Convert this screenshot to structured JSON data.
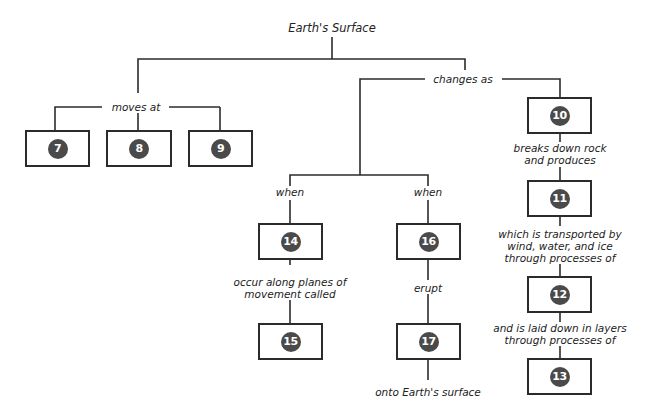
{
  "diagram": {
    "title": "Earth's Surface",
    "links": {
      "moves_at": "moves at",
      "changes_as": "changes as",
      "when_left": "when",
      "when_right": "when",
      "occur_along_1": "occur along planes of",
      "occur_along_2": "movement called",
      "erupt": "erupt",
      "onto_surface": "onto Earth's surface",
      "breaks_1": "breaks down rock",
      "breaks_2": "and produces",
      "transported_1": "which is transported by",
      "transported_2": "wind, water, and ice",
      "transported_3": "through processes of",
      "laid_1": "and is laid down in layers",
      "laid_2": "through processes of"
    },
    "boxes": {
      "b7": "7",
      "b8": "8",
      "b9": "9",
      "b10": "10",
      "b11": "11",
      "b12": "12",
      "b13": "13",
      "b14": "14",
      "b15": "15",
      "b16": "16",
      "b17": "17"
    },
    "colors": {
      "line": "#2b2b2b",
      "badge": "#4a4a4a"
    }
  }
}
